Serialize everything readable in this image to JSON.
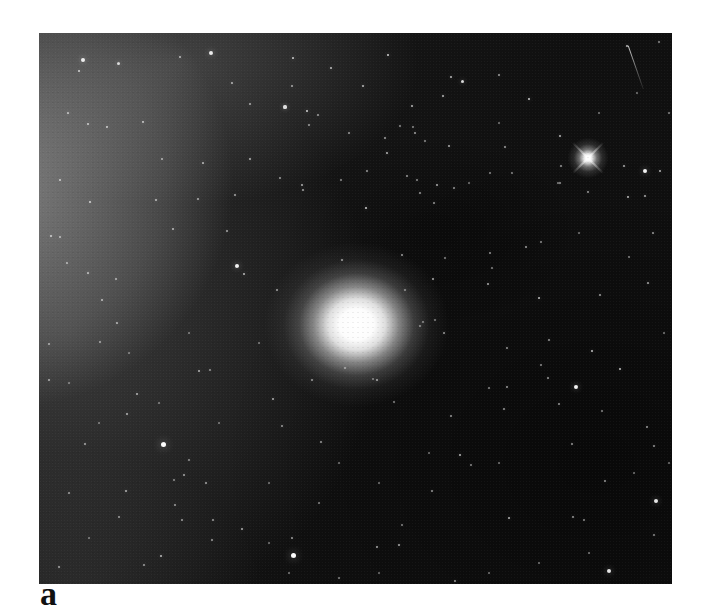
{
  "figure": {
    "label": "a",
    "colors": {
      "page_bg": "#ffffff",
      "photo_bg": "#101010",
      "haze": "#9a9a9a",
      "star": "#ffffff",
      "label_text": "#111111"
    },
    "photo": {
      "left": 39,
      "top": 33,
      "width": 633,
      "height": 551,
      "nebula": {
        "x": 317,
        "y": 291,
        "halo_w": 185,
        "halo_h": 165,
        "core_w": 62,
        "core_h": 50
      },
      "flare_star": {
        "x": 549,
        "y": 125,
        "size": 48
      },
      "streak": {
        "x": 589,
        "y": 12,
        "length": 46,
        "angle_deg": 70.8
      },
      "stars": [
        [
          44,
          27,
          4,
          0.9
        ],
        [
          79,
          30,
          3,
          0.8
        ],
        [
          40,
          38,
          2.5,
          0.75
        ],
        [
          141,
          24,
          2,
          0.65
        ],
        [
          172,
          20,
          4,
          0.9
        ],
        [
          193,
          50,
          2,
          0.65
        ],
        [
          211,
          71,
          2,
          0.6
        ],
        [
          254,
          25,
          2.5,
          0.8
        ],
        [
          292,
          35,
          2.2,
          0.7
        ],
        [
          253,
          53,
          2,
          0.6
        ],
        [
          324,
          53,
          2.2,
          0.7
        ],
        [
          268,
          78,
          2.5,
          0.8
        ],
        [
          279,
          82,
          1.8,
          0.55
        ],
        [
          246,
          74,
          3.2,
          0.85
        ],
        [
          270,
          92,
          1.8,
          0.55
        ],
        [
          29,
          80,
          2.2,
          0.7
        ],
        [
          49,
          91,
          2.2,
          0.7
        ],
        [
          68,
          94,
          2.5,
          0.75
        ],
        [
          104,
          89,
          2.5,
          0.75
        ],
        [
          123,
          126,
          2,
          0.6
        ],
        [
          164,
          130,
          2.5,
          0.7
        ],
        [
          211,
          126,
          2,
          0.65
        ],
        [
          21,
          147,
          2.5,
          0.7
        ],
        [
          51,
          169,
          2.5,
          0.75
        ],
        [
          117,
          167,
          2,
          0.65
        ],
        [
          159,
          166,
          2,
          0.6
        ],
        [
          196,
          162,
          2,
          0.6
        ],
        [
          12,
          203,
          2.2,
          0.7
        ],
        [
          21,
          204,
          2,
          0.6
        ],
        [
          134,
          196,
          2.2,
          0.65
        ],
        [
          188,
          198,
          2,
          0.6
        ],
        [
          28,
          230,
          2,
          0.6
        ],
        [
          49,
          240,
          2.2,
          0.7
        ],
        [
          77,
          246,
          2,
          0.6
        ],
        [
          63,
          267,
          2.2,
          0.65
        ],
        [
          198,
          233,
          4,
          0.95
        ],
        [
          205,
          241,
          2.5,
          0.7
        ],
        [
          238,
          257,
          2,
          0.6
        ],
        [
          263,
          152,
          2.2,
          0.65
        ],
        [
          241,
          145,
          1.8,
          0.55
        ],
        [
          264,
          157,
          2,
          0.6
        ],
        [
          302,
          147,
          1.8,
          0.5
        ],
        [
          310,
          100,
          1.8,
          0.55
        ],
        [
          348,
          120,
          2.2,
          0.7
        ],
        [
          328,
          138,
          1.8,
          0.55
        ],
        [
          361,
          93,
          1.8,
          0.5
        ],
        [
          376,
          100,
          2,
          0.6
        ],
        [
          386,
          108,
          1.8,
          0.5
        ],
        [
          368,
          143,
          1.8,
          0.55
        ],
        [
          378,
          147,
          1.8,
          0.5
        ],
        [
          373,
          73,
          2.2,
          0.7
        ],
        [
          404,
          63,
          2.2,
          0.7
        ],
        [
          349,
          22,
          2.5,
          0.8
        ],
        [
          412,
          44,
          2.2,
          0.7
        ],
        [
          423,
          48,
          3,
          0.85
        ],
        [
          346,
          105,
          2,
          0.6
        ],
        [
          374,
          94,
          1.8,
          0.5
        ],
        [
          460,
          42,
          2,
          0.6
        ],
        [
          490,
          66,
          2.5,
          0.8
        ],
        [
          521,
          103,
          2.2,
          0.7
        ],
        [
          466,
          114,
          2,
          0.6
        ],
        [
          410,
          113,
          2.2,
          0.65
        ],
        [
          398,
          152,
          2.2,
          0.65
        ],
        [
          415,
          155,
          1.8,
          0.55
        ],
        [
          381,
          160,
          1.8,
          0.55
        ],
        [
          395,
          170,
          1.8,
          0.55
        ],
        [
          521,
          150,
          1.8,
          0.55
        ],
        [
          522,
          133,
          1.8,
          0.55
        ],
        [
          549,
          159,
          2,
          0.6
        ],
        [
          585,
          133,
          2.2,
          0.65
        ],
        [
          606,
          138,
          4,
          0.95
        ],
        [
          589,
          164,
          2.5,
          0.75
        ],
        [
          606,
          163,
          2.2,
          0.65
        ],
        [
          621,
          138,
          2.5,
          0.7
        ],
        [
          620,
          9,
          1.8,
          0.5
        ],
        [
          588,
          13,
          2,
          0.7
        ],
        [
          598,
          60,
          1.5,
          0.4
        ],
        [
          560,
          80,
          1.5,
          0.4
        ],
        [
          630,
          80,
          1.5,
          0.45
        ],
        [
          655,
          120,
          1.5,
          0.45
        ],
        [
          460,
          90,
          1.5,
          0.4
        ],
        [
          430,
          150,
          1.5,
          0.4
        ],
        [
          451,
          140,
          1.6,
          0.45
        ],
        [
          473,
          140,
          1.6,
          0.45
        ],
        [
          519,
          150,
          1.6,
          0.45
        ],
        [
          540,
          200,
          1.5,
          0.4
        ],
        [
          614,
          200,
          2,
          0.6
        ],
        [
          590,
          224,
          1.6,
          0.45
        ],
        [
          609,
          250,
          2.2,
          0.65
        ],
        [
          650,
          230,
          1.5,
          0.4
        ],
        [
          625,
          300,
          1.5,
          0.42
        ],
        [
          561,
          262,
          2,
          0.6
        ],
        [
          502,
          209,
          1.8,
          0.5
        ],
        [
          487,
          214,
          2,
          0.6
        ],
        [
          500,
          265,
          2.5,
          0.75
        ],
        [
          449,
          251,
          2.2,
          0.65
        ],
        [
          394,
          246,
          2.2,
          0.65
        ],
        [
          363,
          222,
          2,
          0.6
        ],
        [
          327,
          175,
          2.5,
          0.8
        ],
        [
          451,
          220,
          2,
          0.55
        ],
        [
          406,
          225,
          1.6,
          0.45
        ],
        [
          453,
          235,
          1.6,
          0.45
        ],
        [
          303,
          227,
          2,
          0.65
        ],
        [
          366,
          257,
          1.8,
          0.55
        ],
        [
          384,
          289,
          1.8,
          0.55
        ],
        [
          396,
          287,
          1.6,
          0.45
        ],
        [
          306,
          335,
          2,
          0.6
        ],
        [
          338,
          347,
          2.2,
          0.7
        ],
        [
          273,
          347,
          2,
          0.6
        ],
        [
          78,
          290,
          2.2,
          0.65
        ],
        [
          10,
          311,
          1.8,
          0.55
        ],
        [
          61,
          309,
          1.8,
          0.55
        ],
        [
          90,
          320,
          1.5,
          0.4
        ],
        [
          150,
          300,
          1.5,
          0.4
        ],
        [
          220,
          310,
          1.5,
          0.4
        ],
        [
          160,
          338,
          2.2,
          0.65
        ],
        [
          171,
          337,
          1.8,
          0.5
        ],
        [
          10,
          347,
          2,
          0.6
        ],
        [
          30,
          350,
          1.5,
          0.4
        ],
        [
          98,
          361,
          2.2,
          0.65
        ],
        [
          88,
          381,
          2.2,
          0.65
        ],
        [
          120,
          370,
          1.5,
          0.4
        ],
        [
          180,
          390,
          1.5,
          0.4
        ],
        [
          60,
          390,
          1.5,
          0.4
        ],
        [
          234,
          366,
          2.2,
          0.65
        ],
        [
          243,
          393,
          1.8,
          0.55
        ],
        [
          282,
          409,
          1.8,
          0.55
        ],
        [
          46,
          411,
          2,
          0.6
        ],
        [
          124,
          411,
          5,
          1
        ],
        [
          150,
          427,
          1.8,
          0.5
        ],
        [
          145,
          442,
          2,
          0.6
        ],
        [
          167,
          450,
          2,
          0.6
        ],
        [
          135,
          447,
          1.6,
          0.45
        ],
        [
          30,
          460,
          1.8,
          0.55
        ],
        [
          87,
          458,
          2.2,
          0.65
        ],
        [
          136,
          472,
          1.8,
          0.55
        ],
        [
          80,
          484,
          1.8,
          0.55
        ],
        [
          143,
          487,
          1.8,
          0.55
        ],
        [
          174,
          487,
          1.8,
          0.55
        ],
        [
          173,
          507,
          1.8,
          0.55
        ],
        [
          203,
          496,
          2.2,
          0.65
        ],
        [
          253,
          505,
          2,
          0.6
        ],
        [
          122,
          523,
          2.2,
          0.7
        ],
        [
          105,
          532,
          1.8,
          0.55
        ],
        [
          20,
          534,
          2,
          0.6
        ],
        [
          50,
          505,
          1.5,
          0.4
        ],
        [
          230,
          510,
          1.5,
          0.4
        ],
        [
          250,
          540,
          1.5,
          0.42
        ],
        [
          300,
          545,
          1.6,
          0.45
        ],
        [
          254,
          522,
          5,
          1
        ],
        [
          340,
          540,
          1.4,
          0.38
        ],
        [
          381,
          293,
          1.8,
          0.55
        ],
        [
          405,
          300,
          2,
          0.6
        ],
        [
          468,
          315,
          1.8,
          0.55
        ],
        [
          510,
          307,
          1.8,
          0.55
        ],
        [
          553,
          318,
          2.5,
          0.75
        ],
        [
          581,
          336,
          2.5,
          0.75
        ],
        [
          509,
          345,
          2,
          0.6
        ],
        [
          468,
          354,
          2,
          0.6
        ],
        [
          450,
          355,
          1.8,
          0.5
        ],
        [
          502,
          332,
          1.8,
          0.5
        ],
        [
          537,
          354,
          4,
          0.95
        ],
        [
          412,
          383,
          1.8,
          0.55
        ],
        [
          421,
          422,
          2.2,
          0.7
        ],
        [
          465,
          376,
          1.8,
          0.55
        ],
        [
          520,
          371,
          1.8,
          0.55
        ],
        [
          563,
          378,
          1.6,
          0.45
        ],
        [
          608,
          394,
          2,
          0.6
        ],
        [
          615,
          413,
          1.8,
          0.55
        ],
        [
          533,
          411,
          1.8,
          0.55
        ],
        [
          566,
          448,
          1.8,
          0.55
        ],
        [
          470,
          485,
          2.2,
          0.7
        ],
        [
          534,
          484,
          2,
          0.6
        ],
        [
          545,
          487,
          1.8,
          0.5
        ],
        [
          432,
          432,
          1.8,
          0.5
        ],
        [
          393,
          458,
          1.8,
          0.55
        ],
        [
          360,
          512,
          2,
          0.65
        ],
        [
          338,
          514,
          2,
          0.65
        ],
        [
          416,
          548,
          1.8,
          0.55
        ],
        [
          615,
          502,
          1.8,
          0.5
        ],
        [
          363,
          492,
          1.6,
          0.45
        ],
        [
          334,
          346,
          1.6,
          0.45
        ],
        [
          355,
          369,
          1.6,
          0.45
        ],
        [
          390,
          420,
          1.5,
          0.4
        ],
        [
          460,
          430,
          1.5,
          0.4
        ],
        [
          630,
          430,
          1.5,
          0.4
        ],
        [
          595,
          440,
          1.5,
          0.4
        ],
        [
          640,
          530,
          1.5,
          0.4
        ],
        [
          550,
          520,
          1.5,
          0.42
        ],
        [
          500,
          530,
          1.5,
          0.4
        ],
        [
          450,
          540,
          1.5,
          0.4
        ],
        [
          617,
          468,
          4,
          0.9
        ],
        [
          570,
          538,
          4,
          0.9
        ],
        [
          280,
          470,
          1.6,
          0.45
        ],
        [
          230,
          450,
          1.5,
          0.4
        ],
        [
          300,
          430,
          1.5,
          0.4
        ],
        [
          340,
          450,
          1.5,
          0.4
        ]
      ]
    }
  }
}
